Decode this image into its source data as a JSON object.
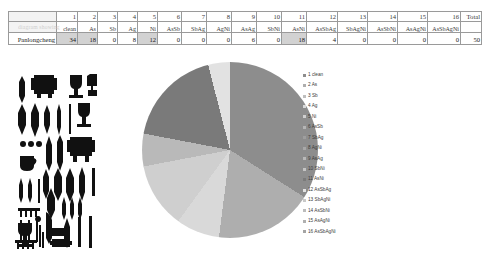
{
  "table": {
    "corner_faint_text": "diagram showing",
    "column_numbers": [
      "1",
      "2",
      "3",
      "4",
      "5",
      "6",
      "7",
      "8",
      "9",
      "10",
      "11",
      "12",
      "13",
      "14",
      "15",
      "16"
    ],
    "total_header": "Total",
    "column_labels": [
      "clean",
      "As",
      "Sb",
      "Ag",
      "Ni",
      "AsSb",
      "SbAg",
      "AgNi",
      "AsAg",
      "SbNi",
      "AsNi",
      "AsSbAg",
      "SbAgNi",
      "AsSbNi",
      "AsAgNi",
      "AsSbAgNi"
    ],
    "row_label": "Panlongcheng",
    "values": [
      "34",
      "18",
      "0",
      "8",
      "12",
      "0",
      "0",
      "0",
      "6",
      "0",
      "18",
      "4",
      "0",
      "0",
      "0",
      "0"
    ],
    "total_value": "50",
    "highlighted_indices": [
      0,
      1,
      4,
      10
    ]
  },
  "chart_data": {
    "type": "pie",
    "title": "",
    "categories": [
      "1 clean",
      "2 As",
      "3 Sb",
      "4 Ag",
      "5 Ni",
      "6 AsSb",
      "7 SbAg",
      "8 AgNi",
      "9 AsAg",
      "10 SbNi",
      "11 AsNi",
      "12 AsSbAg",
      "13 SbAgNi",
      "14 AsSbNi",
      "15 AsAgNi",
      "16 AsSbAgNi"
    ],
    "values": [
      34,
      18,
      0,
      8,
      12,
      0,
      0,
      0,
      6,
      0,
      18,
      4,
      0,
      0,
      0,
      0
    ],
    "colors": [
      "#8d8d8d",
      "#aeaeae",
      "#bfbfbf",
      "#d9d9d9",
      "#cfcfcf",
      "#b5b5b5",
      "#9e9e9e",
      "#a8a8a8",
      "#b9b9b9",
      "#c4c4c4",
      "#7a7a7a",
      "#e2e2e2",
      "#c9c9c9",
      "#bcbcbc",
      "#b0b0b0",
      "#a4a4a4"
    ],
    "legend_position": "right",
    "grid": false,
    "total": 100
  },
  "legend": {
    "items": [
      {
        "label": "1 clean",
        "color": "#8d8d8d"
      },
      {
        "label": "2 As",
        "color": "#aeaeae"
      },
      {
        "label": "3 Sb",
        "color": "#bfbfbf"
      },
      {
        "label": "4 Ag",
        "color": "#d9d9d9"
      },
      {
        "label": "5 Ni",
        "color": "#cfcfcf"
      },
      {
        "label": "6 AsSb",
        "color": "#b5b5b5"
      },
      {
        "label": "7 SbAg",
        "color": "#9e9e9e"
      },
      {
        "label": "8 AgNi",
        "color": "#a8a8a8"
      },
      {
        "label": "9 AsAg",
        "color": "#b9b9b9"
      },
      {
        "label": "10 SbNi",
        "color": "#c4c4c4"
      },
      {
        "label": "11 AsNi",
        "color": "#7a7a7a"
      },
      {
        "label": "12 AsSbAg",
        "color": "#e2e2e2"
      },
      {
        "label": "13 SbAgNi",
        "color": "#c9c9c9"
      },
      {
        "label": "14 AsSbNi",
        "color": "#bcbcbc"
      },
      {
        "label": "15 AsAgNi",
        "color": "#b0b0b0"
      },
      {
        "label": "16 AsSbAgNi",
        "color": "#a4a4a4"
      }
    ]
  },
  "figure": {
    "artifact_plate_caption": ""
  }
}
